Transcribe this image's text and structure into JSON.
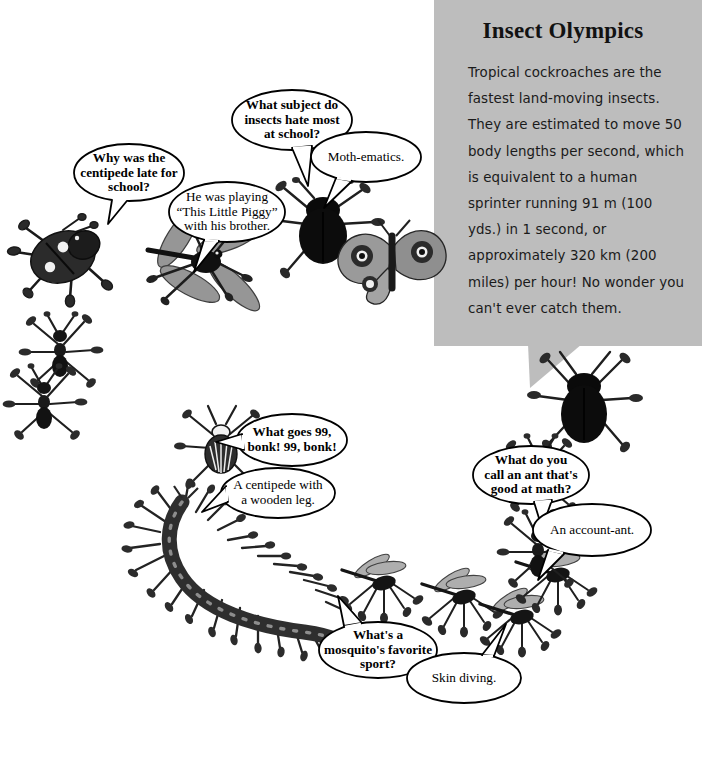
{
  "page": {
    "background_color": "#ffffff",
    "width": 702,
    "height": 760
  },
  "info_panel": {
    "background_color": "#bdbdbd",
    "title": "Insect Olympics",
    "body": "Tropical cockroaches are the fastest land-moving insects. They are estimated to move 50 body lengths per second, which is equivalent to a human sprinter running 91 m (100 yds.) in 1 second, or approximately 320 km (200 miles) per hour! No wonder you can't ever catch them."
  },
  "jokes": [
    {
      "id": "centipede-late",
      "question": "Why was the\ncentipede late for\nschool?",
      "answer": "He was playing\n“This Little Piggy”\nwith his brother."
    },
    {
      "id": "subject-hated",
      "question": "What subject do\ninsects hate most\nat school?",
      "answer": "Moth-ematics."
    },
    {
      "id": "bonk-99",
      "question": "What goes 99,\nbonk! 99, bonk!",
      "answer": "A centipede with\na wooden leg."
    },
    {
      "id": "math-ant",
      "question": "What do you\ncall an ant that's\ngood at math?",
      "answer": "An account-ant."
    },
    {
      "id": "mosquito-sport",
      "question": "What's a\nmosquito's favorite\nsport?",
      "answer": "Skin diving."
    }
  ],
  "insects": [
    {
      "name": "ladybug",
      "label": "ladybug-beetle"
    },
    {
      "name": "dragonfly",
      "label": "dragonfly"
    },
    {
      "name": "ant-trail-1",
      "label": "ant"
    },
    {
      "name": "ant-trail-2",
      "label": "ant"
    },
    {
      "name": "ant-trail-3",
      "label": "ant"
    },
    {
      "name": "cockroach-top",
      "label": "cockroach"
    },
    {
      "name": "moth",
      "label": "moth"
    },
    {
      "name": "cockroach-right",
      "label": "cockroach"
    },
    {
      "name": "striped-beetle",
      "label": "striped-beetle"
    },
    {
      "name": "centipede",
      "label": "centipede"
    },
    {
      "name": "mosquito-1",
      "label": "mosquito"
    },
    {
      "name": "mosquito-2",
      "label": "mosquito"
    },
    {
      "name": "mosquito-3",
      "label": "mosquito"
    },
    {
      "name": "mosquito-4",
      "label": "mosquito"
    },
    {
      "name": "ant-right-1",
      "label": "ant"
    },
    {
      "name": "ant-right-2",
      "label": "ant"
    }
  ]
}
